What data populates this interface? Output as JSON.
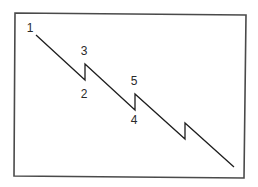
{
  "diagram": {
    "type": "zigzag-wave-pattern",
    "frame": {
      "corners": [
        [
          15,
          13
        ],
        [
          246,
          15
        ],
        [
          244,
          178
        ],
        [
          14,
          176
        ]
      ],
      "stroke_color": "#4a4a4a"
    },
    "line": {
      "stroke_color": "#1e1e1e",
      "points": [
        [
          36,
          35
        ],
        [
          85,
          80
        ],
        [
          85,
          64
        ],
        [
          135,
          110
        ],
        [
          135,
          94
        ],
        [
          185,
          139
        ],
        [
          185,
          123
        ],
        [
          234,
          167
        ]
      ]
    },
    "labels": [
      {
        "id": "p1",
        "text": "1",
        "x": 30,
        "y": 29
      },
      {
        "id": "p2",
        "text": "2",
        "x": 84,
        "y": 95
      },
      {
        "id": "p3",
        "text": "3",
        "x": 84,
        "y": 52
      },
      {
        "id": "p4",
        "text": "4",
        "x": 134,
        "y": 121
      },
      {
        "id": "p5",
        "text": "5",
        "x": 134,
        "y": 82
      }
    ]
  }
}
